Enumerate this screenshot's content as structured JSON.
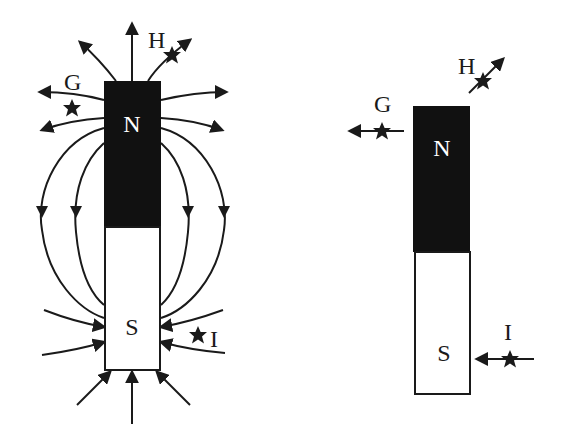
{
  "diagram": {
    "type": "bar-magnet-field-lines",
    "colors": {
      "ink": "#1a1a1a",
      "north_fill": "#111111",
      "south_fill": "#ffffff",
      "background": "#ffffff"
    },
    "left_magnet": {
      "north_label": "N",
      "south_label": "S",
      "points": [
        {
          "label": "G",
          "marker": "star"
        },
        {
          "label": "H",
          "marker": "star"
        },
        {
          "label": "I",
          "marker": "star"
        }
      ]
    },
    "right_magnet": {
      "north_label": "N",
      "south_label": "S",
      "points": [
        {
          "label": "G",
          "marker": "star",
          "arrow_direction": "left"
        },
        {
          "label": "H",
          "marker": "star",
          "arrow_direction": "up-right"
        },
        {
          "label": "I",
          "marker": "star",
          "arrow_direction": "left"
        }
      ]
    }
  }
}
